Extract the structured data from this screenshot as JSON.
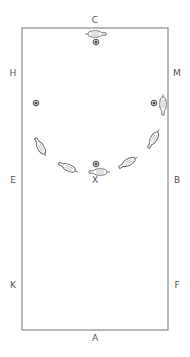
{
  "diagram": {
    "type": "dressage-arena",
    "arena": {
      "x": 22,
      "y": 28,
      "width": 146,
      "height": 302,
      "stroke": "#8a8a8a"
    },
    "markers": [
      {
        "id": "C",
        "label": "C",
        "x": 95,
        "y": 20
      },
      {
        "id": "H",
        "label": "H",
        "x": 13,
        "y": 73
      },
      {
        "id": "M",
        "label": "M",
        "x": 177,
        "y": 73
      },
      {
        "id": "E",
        "label": "E",
        "x": 13,
        "y": 180
      },
      {
        "id": "B",
        "label": "B",
        "x": 177,
        "y": 180
      },
      {
        "id": "X",
        "label": "X",
        "x": 95,
        "y": 180
      },
      {
        "id": "K",
        "label": "K",
        "x": 13,
        "y": 285
      },
      {
        "id": "F",
        "label": "F",
        "x": 177,
        "y": 285
      },
      {
        "id": "A",
        "label": "A",
        "x": 95,
        "y": 338
      }
    ],
    "cones": [
      {
        "x": 96,
        "y": 42
      },
      {
        "x": 36,
        "y": 103
      },
      {
        "x": 154,
        "y": 103
      },
      {
        "x": 96,
        "y": 164
      }
    ],
    "horses": [
      {
        "x": 97,
        "y": 34,
        "angle": 0
      },
      {
        "x": 163,
        "y": 106,
        "angle": 90
      },
      {
        "x": 153,
        "y": 140,
        "angle": 120
      },
      {
        "x": 127,
        "y": 163,
        "angle": 150
      },
      {
        "x": 98,
        "y": 172,
        "angle": 180
      },
      {
        "x": 67,
        "y": 167,
        "angle": 205
      },
      {
        "x": 40,
        "y": 146,
        "angle": 240
      }
    ],
    "colors": {
      "line": "#8a8a8a",
      "text": "#555555",
      "cone": "#444444",
      "horse": "#666666"
    }
  }
}
